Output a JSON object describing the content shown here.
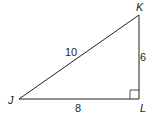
{
  "figure": {
    "type": "right-triangle",
    "vertices": {
      "J": {
        "label": "J",
        "x": 19,
        "y": 99
      },
      "K": {
        "label": "K",
        "x": 139,
        "y": 15
      },
      "L": {
        "label": "L",
        "x": 139,
        "y": 99
      }
    },
    "sides": {
      "JK": {
        "label": "10"
      },
      "JL": {
        "label": "8"
      },
      "KL": {
        "label": "6"
      }
    },
    "right_angle_at": "L",
    "stroke_color": "#231f20"
  }
}
